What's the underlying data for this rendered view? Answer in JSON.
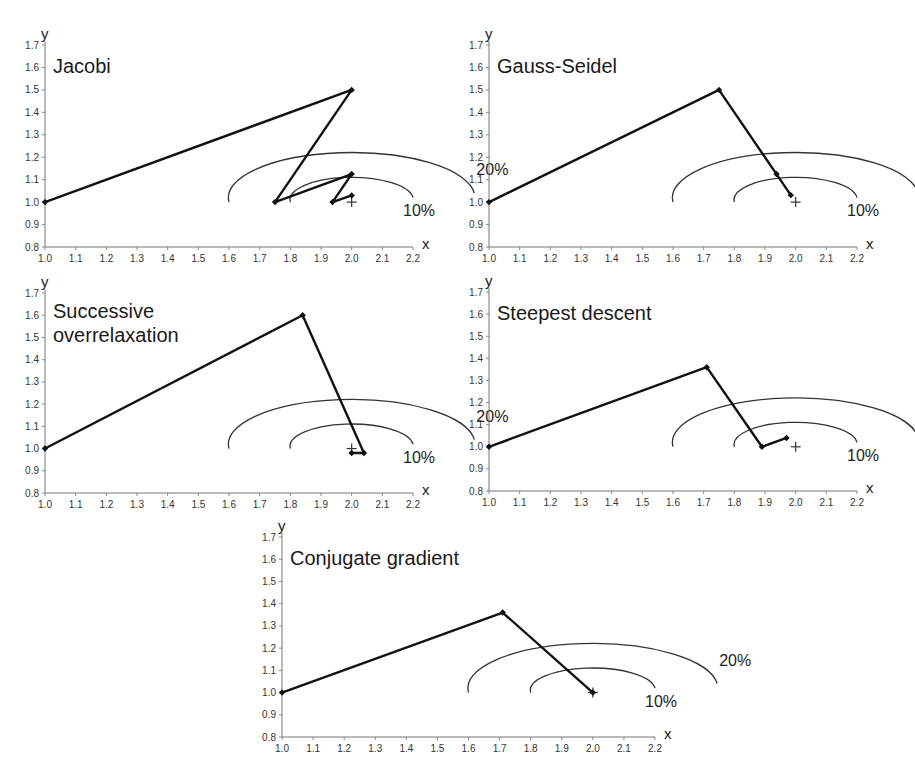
{
  "figure": {
    "panel_count": 5
  },
  "chart_data": [
    {
      "id": "jacobi",
      "type": "line",
      "title": "Jacobi",
      "xlabel": "x",
      "ylabel": "y",
      "xlim": [
        1.0,
        2.2
      ],
      "ylim": [
        0.8,
        1.7
      ],
      "xticks": [
        "1.0",
        "1.1",
        "1.2",
        "1.3",
        "1.4",
        "1.5",
        "1.6",
        "1.7",
        "1.8",
        "1.9",
        "2.0",
        "2.1",
        "2.2"
      ],
      "yticks": [
        "0.8",
        "0.9",
        "1.0",
        "1.1",
        "1.2",
        "1.3",
        "1.4",
        "1.5",
        "1.6",
        "1.7"
      ],
      "grid": false,
      "series": [
        {
          "name": "iterates",
          "points": [
            [
              1.0,
              1.0
            ],
            [
              2.0,
              1.5
            ],
            [
              1.75,
              1.0
            ],
            [
              2.0,
              1.125
            ],
            [
              1.9375,
              1.0
            ],
            [
              2.0,
              1.03
            ]
          ]
        }
      ],
      "target": [
        2.0,
        1.0
      ],
      "contours": [
        {
          "label": "20%",
          "cx": 2.0,
          "cy": 1.0,
          "rx": 0.4,
          "ry": 0.2
        },
        {
          "label": "10%",
          "cx": 2.0,
          "cy": 1.0,
          "rx": 0.2,
          "ry": 0.1
        }
      ]
    },
    {
      "id": "gauss-seidel",
      "type": "line",
      "title": "Gauss-Seidel",
      "xlabel": "x",
      "ylabel": "y",
      "xlim": [
        1.0,
        2.2
      ],
      "ylim": [
        0.8,
        1.7
      ],
      "xticks": [
        "1.0",
        "1.1",
        "1.2",
        "1.3",
        "1.4",
        "1.5",
        "1.6",
        "1.7",
        "1.8",
        "1.9",
        "2.0",
        "2.1",
        "2.2"
      ],
      "yticks": [
        "0.8",
        "0.9",
        "1.0",
        "1.1",
        "1.2",
        "1.3",
        "1.4",
        "1.5",
        "1.6",
        "1.7"
      ],
      "grid": false,
      "series": [
        {
          "name": "iterates",
          "points": [
            [
              1.0,
              1.0
            ],
            [
              1.75,
              1.5
            ],
            [
              1.9375,
              1.125
            ],
            [
              1.984,
              1.031
            ]
          ]
        }
      ],
      "target": [
        2.0,
        1.0
      ],
      "contours": [
        {
          "label": "20%",
          "cx": 2.0,
          "cy": 1.0,
          "rx": 0.4,
          "ry": 0.2
        },
        {
          "label": "10%",
          "cx": 2.0,
          "cy": 1.0,
          "rx": 0.2,
          "ry": 0.1
        }
      ]
    },
    {
      "id": "sor",
      "type": "line",
      "title": "Successive overrelaxation",
      "title_lines": [
        "Successive",
        "overrelaxation"
      ],
      "xlabel": "x",
      "ylabel": "y",
      "xlim": [
        1.0,
        2.2
      ],
      "ylim": [
        0.8,
        1.7
      ],
      "xticks": [
        "1.0",
        "1.1",
        "1.2",
        "1.3",
        "1.4",
        "1.5",
        "1.6",
        "1.7",
        "1.8",
        "1.9",
        "2.0",
        "2.1",
        "2.2"
      ],
      "yticks": [
        "0.8",
        "0.9",
        "1.0",
        "1.1",
        "1.2",
        "1.3",
        "1.4",
        "1.5",
        "1.6",
        "1.7"
      ],
      "grid": false,
      "series": [
        {
          "name": "iterates",
          "points": [
            [
              1.0,
              1.0
            ],
            [
              1.84,
              1.6
            ],
            [
              2.04,
              0.98
            ],
            [
              2.0,
              0.98
            ]
          ]
        }
      ],
      "target": [
        2.0,
        1.0
      ],
      "contours": [
        {
          "label": "20%",
          "cx": 2.0,
          "cy": 1.0,
          "rx": 0.4,
          "ry": 0.2
        },
        {
          "label": "10%",
          "cx": 2.0,
          "cy": 1.0,
          "rx": 0.2,
          "ry": 0.1
        }
      ]
    },
    {
      "id": "steepest-descent",
      "type": "line",
      "title": "Steepest descent",
      "xlabel": "x",
      "ylabel": "y",
      "xlim": [
        1.0,
        2.2
      ],
      "ylim": [
        0.8,
        1.7
      ],
      "xticks": [
        "1.0",
        "1.1",
        "1.2",
        "1.3",
        "1.4",
        "1.5",
        "1.6",
        "1.7",
        "1.8",
        "1.9",
        "2.0",
        "2.1",
        "2.2"
      ],
      "yticks": [
        "0.8",
        "0.9",
        "1.0",
        "1.1",
        "1.2",
        "1.3",
        "1.4",
        "1.5",
        "1.6",
        "1.7"
      ],
      "grid": false,
      "series": [
        {
          "name": "iterates",
          "points": [
            [
              1.0,
              1.0
            ],
            [
              1.71,
              1.36
            ],
            [
              1.89,
              1.0
            ],
            [
              1.97,
              1.04
            ]
          ]
        }
      ],
      "target": [
        2.0,
        1.0
      ],
      "contours": [
        {
          "label": "20%",
          "cx": 2.0,
          "cy": 1.0,
          "rx": 0.4,
          "ry": 0.2
        },
        {
          "label": "10%",
          "cx": 2.0,
          "cy": 1.0,
          "rx": 0.2,
          "ry": 0.1
        }
      ]
    },
    {
      "id": "conjugate-gradient",
      "type": "line",
      "title": "Conjugate gradient",
      "xlabel": "x",
      "ylabel": "y",
      "xlim": [
        1.0,
        2.2
      ],
      "ylim": [
        0.8,
        1.7
      ],
      "xticks": [
        "1.0",
        "1.1",
        "1.2",
        "1.3",
        "1.4",
        "1.5",
        "1.6",
        "1.7",
        "1.8",
        "1.9",
        "2.0",
        "2.1",
        "2.2"
      ],
      "yticks": [
        "0.8",
        "0.9",
        "1.0",
        "1.1",
        "1.2",
        "1.3",
        "1.4",
        "1.5",
        "1.6",
        "1.7"
      ],
      "grid": false,
      "series": [
        {
          "name": "iterates",
          "points": [
            [
              1.0,
              1.0
            ],
            [
              1.71,
              1.36
            ],
            [
              2.0,
              1.0
            ]
          ]
        }
      ],
      "target": [
        2.0,
        1.0
      ],
      "contours": [
        {
          "label": "20%",
          "cx": 2.0,
          "cy": 1.0,
          "rx": 0.4,
          "ry": 0.2
        },
        {
          "label": "10%",
          "cx": 2.0,
          "cy": 1.0,
          "rx": 0.2,
          "ry": 0.1
        }
      ]
    }
  ],
  "layout": {
    "panels": [
      {
        "chart": 0,
        "x0": 45,
        "x1": 413,
        "y0": 247,
        "y1": 45
      },
      {
        "chart": 1,
        "x0": 489,
        "x1": 857,
        "y0": 247,
        "y1": 45
      },
      {
        "chart": 2,
        "x0": 45,
        "x1": 413,
        "y0": 493,
        "y1": 293
      },
      {
        "chart": 3,
        "x0": 489,
        "x1": 857,
        "y0": 491,
        "y1": 292
      },
      {
        "chart": 4,
        "x0": 282,
        "x1": 655,
        "y0": 737,
        "y1": 537
      }
    ]
  }
}
